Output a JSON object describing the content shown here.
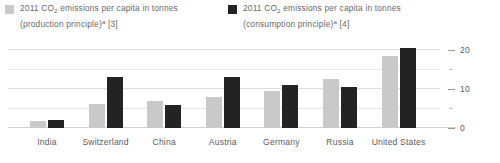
{
  "chart_data": {
    "type": "bar",
    "title": "",
    "xlabel": "",
    "ylabel": "",
    "ylim": [
      0,
      22
    ],
    "grid": true,
    "legend_position": "top",
    "categories": [
      "India",
      "Switzerland",
      "China",
      "Austria",
      "Germany",
      "Russia",
      "United States"
    ],
    "series": [
      {
        "name": "2011 CO2 emissions per capita in tonnes (production principle)a [3]",
        "color": "#c9c9c9",
        "values": [
          1.8,
          6.2,
          7.0,
          8.0,
          9.5,
          12.5,
          18.5
        ]
      },
      {
        "name": "2011 CO2 emissions per capita in tonnes (consumption principle)a [4]",
        "color": "#232323",
        "values": [
          2.0,
          13.0,
          6.0,
          13.0,
          11.0,
          10.5,
          20.5
        ]
      }
    ],
    "yticks": [
      0,
      10,
      20
    ],
    "yticks_minor": [
      5,
      15
    ]
  },
  "legend": {
    "production": {
      "year": "2011",
      "prefix": "CO",
      "subscript": "2",
      "line1_rest": " emissions per capita in tonnes",
      "line2": "(production principle)",
      "superscript": "a",
      "reference": " [3]",
      "swatch_color": "#c9c9c9"
    },
    "consumption": {
      "year": "2011",
      "prefix": "CO",
      "subscript": "2",
      "line1_rest": " emissions per capita in tonnes",
      "line2": "(consumption principle)",
      "superscript": "a",
      "reference": " [4]",
      "swatch_color": "#232323"
    }
  },
  "axis": {
    "y_labels": [
      "20",
      "10",
      "0"
    ]
  }
}
